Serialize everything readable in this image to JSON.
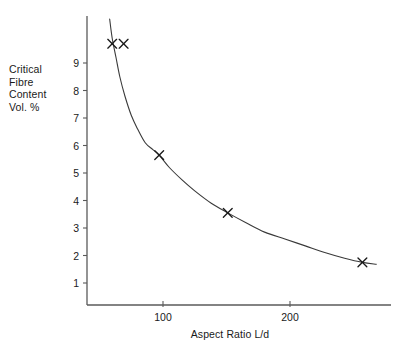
{
  "chart_data": {
    "type": "line",
    "title": "",
    "subtitle": "",
    "xlabel": "Aspect Ratio L/d",
    "ylabel": "Critical Fibre Content Vol. %",
    "ylabel_lines": [
      "Critical",
      "Fibre",
      "Content",
      "Vol. %"
    ],
    "xlim": [
      50,
      290
    ],
    "ylim": [
      0,
      10.2
    ],
    "grid": false,
    "legend": null,
    "xticks": [
      100,
      200
    ],
    "xtick_labels": [
      "100",
      "200"
    ],
    "yticks": [
      1,
      2,
      3,
      4,
      5,
      6,
      7,
      8,
      9
    ],
    "ytick_labels": [
      "1",
      "2",
      "3",
      "4",
      "5",
      "6",
      "7",
      "8",
      "9"
    ],
    "marker": "x",
    "line_color": "#3a3a3a",
    "marker_color": "#1a1a1a",
    "axis_color": "#5a5a5a",
    "background": "#ffffff",
    "series": [
      {
        "name": "Critical fibre content",
        "marker_points": [
          {
            "x": 60,
            "y": 9.7
          },
          {
            "x": 69,
            "y": 9.7
          },
          {
            "x": 97,
            "y": 5.65
          },
          {
            "x": 151,
            "y": 3.55
          },
          {
            "x": 257,
            "y": 1.75
          }
        ],
        "curve_points": [
          {
            "x": 58,
            "y": 10.6
          },
          {
            "x": 60,
            "y": 9.9
          },
          {
            "x": 63,
            "y": 9.2
          },
          {
            "x": 66,
            "y": 8.5
          },
          {
            "x": 70,
            "y": 7.8
          },
          {
            "x": 75,
            "y": 7.1
          },
          {
            "x": 80,
            "y": 6.6
          },
          {
            "x": 86,
            "y": 6.1
          },
          {
            "x": 92,
            "y": 5.85
          },
          {
            "x": 97,
            "y": 5.65
          },
          {
            "x": 105,
            "y": 5.2
          },
          {
            "x": 115,
            "y": 4.75
          },
          {
            "x": 125,
            "y": 4.35
          },
          {
            "x": 138,
            "y": 3.9
          },
          {
            "x": 151,
            "y": 3.55
          },
          {
            "x": 165,
            "y": 3.2
          },
          {
            "x": 180,
            "y": 2.85
          },
          {
            "x": 196,
            "y": 2.6
          },
          {
            "x": 212,
            "y": 2.35
          },
          {
            "x": 228,
            "y": 2.1
          },
          {
            "x": 243,
            "y": 1.9
          },
          {
            "x": 257,
            "y": 1.75
          },
          {
            "x": 268,
            "y": 1.68
          }
        ]
      }
    ]
  }
}
